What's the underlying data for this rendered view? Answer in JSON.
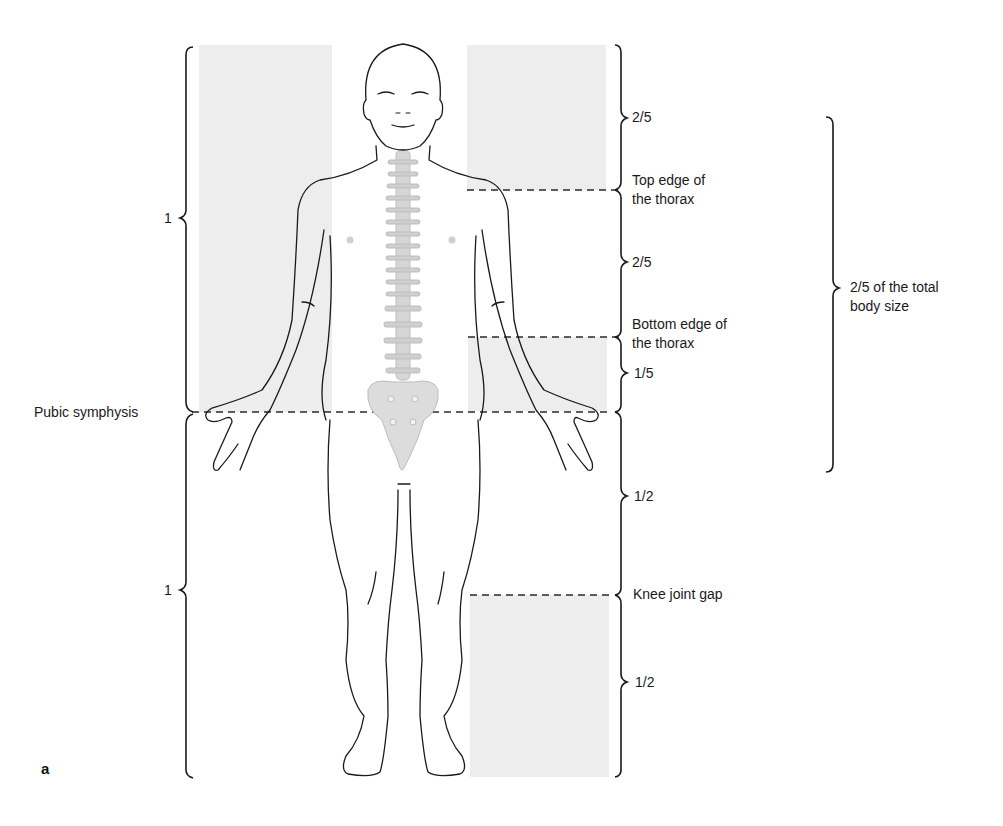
{
  "figure": {
    "panel_letter": "a",
    "colors": {
      "shade": "#ededed",
      "line": "#1a1a1a",
      "dashed": "#2a2a2a",
      "spine": "#c9c9c9"
    },
    "left_brackets": [
      {
        "label": "1",
        "segment": "upper body (crown to pubic symphysis)"
      },
      {
        "label": "1",
        "segment": "lower body (pubic symphysis to sole)"
      }
    ],
    "left_labels": {
      "pubic_symphysis": "Pubic symphysis"
    },
    "right_brackets": [
      {
        "label": "2/5"
      },
      {
        "label": "2/5"
      },
      {
        "label": "1/5"
      },
      {
        "label": "1/2"
      },
      {
        "label": "1/2"
      }
    ],
    "right_labels": {
      "top_thorax_line1": "Top edge of",
      "top_thorax_line2": "the thorax",
      "bottom_thorax_line1": "Bottom edge of",
      "bottom_thorax_line2": "the thorax",
      "knee": "Knee joint gap"
    },
    "outer_bracket": {
      "line1": "2/5 of the total",
      "line2": "body size"
    }
  }
}
